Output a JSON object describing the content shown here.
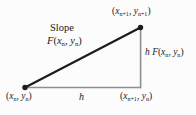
{
  "figure": {
    "kind": "geometric-diagram",
    "background_color": "#fcfcfc",
    "width": 196,
    "height": 115
  },
  "colors": {
    "hypotenuse": "#1c1c1c",
    "leg": "#8e8e8e",
    "vertex_dot": "#1c1c1c",
    "text": "#1a1a1a"
  },
  "geometry": {
    "left_vertex": {
      "x": 25,
      "y": 87.5
    },
    "top_right_vertex": {
      "x": 140.5,
      "y": 27.5
    },
    "bottom_right_vertex": {
      "x": 140.5,
      "y": 87.5
    },
    "hypotenuse_width": 2.1,
    "leg_width": 1.5,
    "dot_radius": 2.6
  },
  "labels": {
    "top_right": {
      "open": "(",
      "x_var": "x",
      "x_sub": "n+1",
      "comma": ", ",
      "y_var": "y",
      "y_sub": "n+1",
      "close": ")"
    },
    "slope_word": "Slope",
    "slope_function": {
      "f": "F",
      "open": "(",
      "x_var": "x",
      "x_sub": "n",
      "comma": ", ",
      "y_var": "y",
      "y_sub": "n",
      "close": ")"
    },
    "right_side": {
      "h": "h",
      "space": " ",
      "f": "F",
      "open": "(",
      "x_var": "x",
      "x_sub": "n",
      "comma": ", ",
      "y_var": "y",
      "y_sub": "n",
      "close": ")"
    },
    "bottom_left": {
      "open": "(",
      "x_var": "x",
      "x_sub": "n",
      "comma": ", ",
      "y_var": "y",
      "y_sub": "n",
      "close": ")"
    },
    "bottom_middle": "h",
    "bottom_right": {
      "open": "(",
      "x_var": "x",
      "x_sub": "n+1",
      "comma": ", ",
      "y_var": "y",
      "y_sub": "n",
      "close": ")"
    }
  }
}
